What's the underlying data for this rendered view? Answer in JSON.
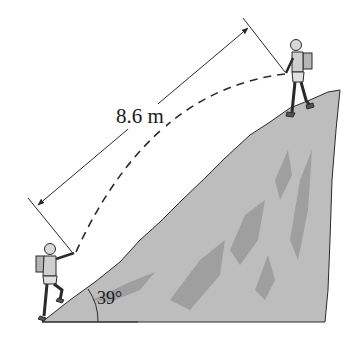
{
  "diagram": {
    "distance_label": "8.6 m",
    "angle_label": "39°",
    "colors": {
      "rock_fill": "#bdbdbd",
      "rock_shadow": "#9a9a9a",
      "line": "#2a2a2a",
      "background": "#ffffff"
    },
    "elements": [
      "lower climber at base of slope",
      "upper hiker at top of slope",
      "dashed trajectory between climbers",
      "dimension line with arrows",
      "rocky incline",
      "angle arc"
    ]
  }
}
